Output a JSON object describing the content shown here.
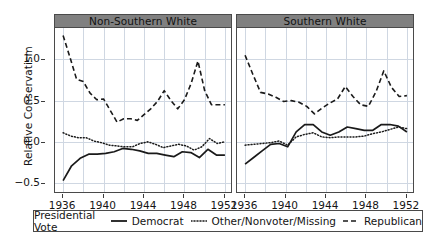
{
  "chart_data": {
    "type": "line",
    "title": "",
    "xlabel": "",
    "ylabel": "Relative Conservatism",
    "ylim": [
      -0.62,
      1.38
    ],
    "xlim": [
      1935.2,
      1952.8
    ],
    "yticks": [
      -0.5,
      0.0,
      0.5,
      1.0
    ],
    "ytick_labels": [
      "-0.5",
      "0.0",
      "0.5",
      "1.0"
    ],
    "xticks": [
      1936,
      1940,
      1944,
      1948,
      1952
    ],
    "xtick_labels": [
      "1936",
      "1940",
      "1944",
      "1948",
      "1952"
    ],
    "grid": true,
    "legend_position": "bottom",
    "legend_title": "Presidential Vote",
    "panels": [
      {
        "label": "Non-Southern White",
        "x": [
          1936,
          1937,
          1938,
          1939,
          1940,
          1941,
          1942,
          1943,
          1944,
          1945,
          1946,
          1947,
          1948,
          1949,
          1950,
          1951,
          1952
        ],
        "series": [
          {
            "name": "Democrat",
            "style": "solid",
            "values": [
              -0.47,
              -0.29,
              -0.2,
              -0.15,
              -0.15,
              -0.14,
              -0.12,
              -0.08,
              -0.09,
              -0.11,
              -0.14,
              -0.14,
              -0.16,
              -0.18,
              -0.12,
              -0.13,
              -0.19,
              -0.09,
              -0.16,
              -0.16
            ]
          },
          {
            "name": "Other/Nonvoter/Missing",
            "style": "dotted",
            "values": [
              0.11,
              0.07,
              0.05,
              0.05,
              0.01,
              -0.01,
              -0.04,
              -0.05,
              -0.06,
              -0.06,
              -0.02,
              0.0,
              -0.03,
              -0.07,
              -0.05,
              -0.03,
              -0.05,
              -0.1,
              -0.06,
              0.04,
              -0.02,
              0.0
            ]
          },
          {
            "name": "Republican",
            "style": "dashed",
            "values": [
              1.29,
              1.03,
              0.76,
              0.73,
              0.59,
              0.51,
              0.52,
              0.38,
              0.24,
              0.28,
              0.28,
              0.26,
              0.33,
              0.4,
              0.49,
              0.62,
              0.5,
              0.4,
              0.51,
              0.71,
              0.98,
              0.62,
              0.45,
              0.45,
              0.45
            ]
          }
        ]
      },
      {
        "label": "Southern White",
        "x": [
          1936,
          1937,
          1938,
          1939,
          1940,
          1941,
          1942,
          1943,
          1944,
          1945,
          1946,
          1947,
          1948,
          1949,
          1950,
          1951,
          1952
        ],
        "series": [
          {
            "name": "Democrat",
            "style": "solid",
            "values": [
              -0.27,
              -0.19,
              -0.11,
              -0.03,
              -0.02,
              -0.06,
              0.12,
              0.21,
              0.21,
              0.12,
              0.08,
              0.12,
              0.18,
              0.16,
              0.14,
              0.14,
              0.21,
              0.21,
              0.19,
              0.12
            ]
          },
          {
            "name": "Other/Nonvoter/Missing",
            "style": "dotted",
            "values": [
              -0.04,
              -0.03,
              -0.02,
              -0.01,
              0.01,
              -0.04,
              0.06,
              0.09,
              0.11,
              0.06,
              0.05,
              0.06,
              0.06,
              0.06,
              0.07,
              0.1,
              0.12,
              0.15,
              0.18,
              0.16
            ]
          },
          {
            "name": "Republican",
            "style": "dashed",
            "values": [
              1.05,
              0.82,
              0.6,
              0.58,
              0.54,
              0.49,
              0.5,
              0.48,
              0.43,
              0.34,
              0.41,
              0.47,
              0.52,
              0.67,
              0.55,
              0.45,
              0.43,
              0.61,
              0.86,
              0.66,
              0.55,
              0.56
            ]
          }
        ]
      }
    ],
    "legend_entries": [
      {
        "label": "Democrat",
        "style": "solid"
      },
      {
        "label": "Other/Nonvoter/Missing",
        "style": "dotted"
      },
      {
        "label": "Republican",
        "style": "dashed"
      }
    ],
    "colors": {
      "line": "#1a1a1a",
      "grid": "#cfd7e2",
      "panel_strip": "#808080",
      "frame": "#4a4a4a",
      "background": "#ffffff"
    }
  }
}
